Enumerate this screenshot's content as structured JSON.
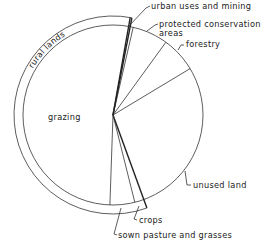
{
  "chart_data": {
    "type": "pie",
    "title": "",
    "units": "degrees of circle (clockwise from top)",
    "slices": [
      {
        "name": "urban uses and mining",
        "label": "urban uses and mining",
        "start_deg": 10,
        "end_deg": 13,
        "percent": 1
      },
      {
        "name": "protected conservation areas",
        "label_lines": [
          "protected conservation",
          "areas"
        ],
        "start_deg": 13,
        "end_deg": 36,
        "percent": 6
      },
      {
        "name": "forestry",
        "label": "forestry",
        "start_deg": 36,
        "end_deg": 59,
        "percent": 6
      },
      {
        "name": "unused land",
        "label": "unused land",
        "start_deg": 59,
        "end_deg": 160,
        "percent": 28
      },
      {
        "name": "crops",
        "label": "crops",
        "start_deg": 160,
        "end_deg": 166,
        "percent": 2
      },
      {
        "name": "sown pasture and grasses",
        "label": "sown pasture and grasses",
        "start_deg": 166,
        "end_deg": 182,
        "percent": 4
      },
      {
        "name": "grazing",
        "label": "grazing",
        "start_deg": 182,
        "end_deg": 370,
        "percent": 52
      }
    ],
    "group_ring": {
      "name": "rural lands",
      "label": "rural lands",
      "covers": [
        "crops",
        "sown pasture and grasses",
        "grazing"
      ],
      "start_deg": 160,
      "end_deg": 371,
      "percent": 58
    },
    "legend": "none (direct labels)"
  }
}
